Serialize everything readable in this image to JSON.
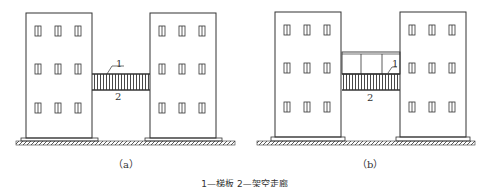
{
  "figure": {
    "panels": [
      {
        "id": "a",
        "label": "（a）",
        "callouts": {
          "one": "1",
          "two": "2"
        },
        "description": "Two three-story buildings connected by a plain bridge slab (1) forming an elevated corridor (2)"
      },
      {
        "id": "b",
        "label": "（b）",
        "callouts": {
          "one": "1",
          "two": "2"
        },
        "description": "Two three-story buildings connected by a bridge slab (1) with an enclosed upper structure, forming an elevated corridor (2)"
      }
    ],
    "caption": "1—梯板  2—架空走廊"
  },
  "colors": {
    "line": "#333333",
    "background": "#ffffff"
  }
}
